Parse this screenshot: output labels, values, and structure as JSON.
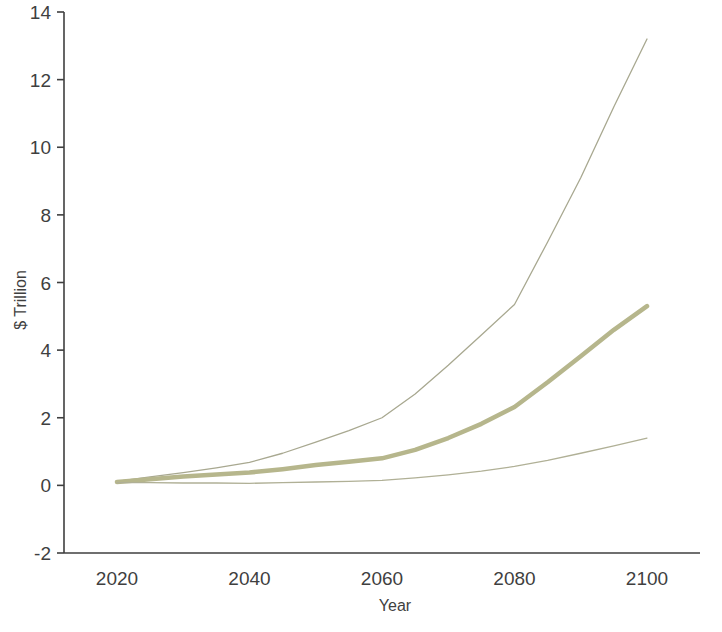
{
  "chart_data": {
    "type": "line",
    "title": "",
    "xlabel": "Year",
    "ylabel": "$ Trillion",
    "xlim": [
      2012,
      2108
    ],
    "ylim": [
      -2,
      14
    ],
    "xticks": [
      2020,
      2040,
      2060,
      2080,
      2100
    ],
    "yticks": [
      -2,
      0,
      2,
      4,
      6,
      8,
      10,
      12,
      14
    ],
    "grid": false,
    "legend": "none",
    "x": [
      2020,
      2025,
      2030,
      2035,
      2040,
      2045,
      2050,
      2055,
      2060,
      2065,
      2070,
      2075,
      2080,
      2085,
      2090,
      2095,
      2100
    ],
    "series": [
      {
        "name": "upper-bound",
        "style": "thin",
        "color": "#a8a890",
        "values": [
          0.12,
          0.25,
          0.38,
          0.52,
          0.68,
          0.95,
          1.28,
          1.62,
          2.0,
          2.7,
          3.55,
          4.45,
          5.35,
          7.2,
          9.1,
          11.2,
          13.2
        ]
      },
      {
        "name": "central-estimate",
        "style": "thick",
        "color": "#b6b68c",
        "values": [
          0.1,
          0.18,
          0.26,
          0.32,
          0.38,
          0.48,
          0.6,
          0.7,
          0.8,
          1.05,
          1.4,
          1.82,
          2.32,
          3.05,
          3.82,
          4.6,
          5.3
        ]
      },
      {
        "name": "lower-bound",
        "style": "thin",
        "color": "#b0b096",
        "values": [
          0.08,
          0.08,
          0.07,
          0.07,
          0.06,
          0.08,
          0.1,
          0.12,
          0.15,
          0.22,
          0.31,
          0.42,
          0.56,
          0.74,
          0.95,
          1.17,
          1.4
        ]
      }
    ]
  },
  "axes": {
    "y_tick_labels": [
      "14",
      "12",
      "10",
      "8",
      "6",
      "4",
      "2",
      "0",
      "-2"
    ],
    "x_tick_labels": [
      "2020",
      "2040",
      "2060",
      "2080",
      "2100"
    ],
    "y_axis_title": "$ Trillion",
    "x_axis_title": "Year",
    "axis_color": "#3f3f3f"
  }
}
